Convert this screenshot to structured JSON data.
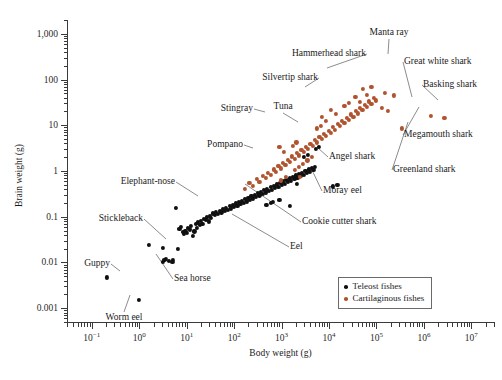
{
  "chart_data": {
    "type": "scatter",
    "title": "",
    "xlabel": "Body weight (g)",
    "ylabel": "Brain weight (g)",
    "xscale": "log",
    "yscale": "log",
    "xlim": [
      0.03,
      30000000
    ],
    "ylim": [
      0.0005,
      2000
    ],
    "grid": false,
    "legend_position": "bottom-right",
    "xticks": [
      {
        "value": 0.1,
        "label": "10",
        "exp": "−1"
      },
      {
        "value": 1,
        "label": "10",
        "exp": "0"
      },
      {
        "value": 10,
        "label": "10",
        "exp": "1"
      },
      {
        "value": 100,
        "label": "10",
        "exp": "2"
      },
      {
        "value": 1000,
        "label": "10",
        "exp": "3"
      },
      {
        "value": 10000,
        "label": "10",
        "exp": "4"
      },
      {
        "value": 100000,
        "label": "10",
        "exp": "5"
      },
      {
        "value": 1000000,
        "label": "10",
        "exp": "6"
      },
      {
        "value": 10000000,
        "label": "10",
        "exp": "7"
      }
    ],
    "yticks": [
      {
        "value": 1000,
        "label": "1,000"
      },
      {
        "value": 100,
        "label": "100"
      },
      {
        "value": 10,
        "label": "10"
      },
      {
        "value": 1,
        "label": "1"
      },
      {
        "value": 0.1,
        "label": "0.1"
      },
      {
        "value": 0.01,
        "label": "0.01"
      },
      {
        "value": 0.001,
        "label": "0.001"
      }
    ],
    "legend": [
      {
        "name": "Teleost fishes",
        "color": "#101010",
        "key": "teleost"
      },
      {
        "name": "Cartilaginous fishes",
        "color": "#b0542f",
        "key": "cart"
      }
    ],
    "series": [
      {
        "name": "Teleost fishes",
        "key": "teleost",
        "color": "#101010",
        "points": [
          [
            0.21,
            0.0047
          ],
          [
            1.0,
            0.00155
          ],
          [
            1.6,
            0.024
          ],
          [
            3.1,
            0.021
          ],
          [
            3.2,
            0.0105
          ],
          [
            3.4,
            0.0112
          ],
          [
            3.6,
            0.0118
          ],
          [
            4.3,
            0.0108
          ],
          [
            5.0,
            0.0105
          ],
          [
            5.2,
            0.0112
          ],
          [
            6.0,
            0.155
          ],
          [
            6.4,
            0.02
          ],
          [
            7.0,
            0.055
          ],
          [
            7.6,
            0.06
          ],
          [
            8.2,
            0.047
          ],
          [
            8.8,
            0.042
          ],
          [
            9.4,
            0.05
          ],
          [
            10.0,
            0.044
          ],
          [
            10.6,
            0.058
          ],
          [
            11.5,
            0.053
          ],
          [
            12.5,
            0.062
          ],
          [
            13.5,
            0.038
          ],
          [
            14.5,
            0.048
          ],
          [
            15.5,
            0.069
          ],
          [
            16.5,
            0.058
          ],
          [
            17.5,
            0.075
          ],
          [
            19.0,
            0.066
          ],
          [
            20.0,
            0.08
          ],
          [
            21.5,
            0.071
          ],
          [
            23.0,
            0.09
          ],
          [
            25.0,
            0.085
          ],
          [
            27.0,
            0.097
          ],
          [
            29.0,
            0.079
          ],
          [
            31.0,
            0.105
          ],
          [
            33.0,
            0.094
          ],
          [
            36.0,
            0.118
          ],
          [
            39.0,
            0.108
          ],
          [
            42.0,
            0.127
          ],
          [
            46.0,
            0.115
          ],
          [
            50.0,
            0.136
          ],
          [
            54.0,
            0.124
          ],
          [
            58.0,
            0.148
          ],
          [
            63.0,
            0.133
          ],
          [
            68.0,
            0.158
          ],
          [
            74.0,
            0.142
          ],
          [
            80.0,
            0.17
          ],
          [
            86.0,
            0.152
          ],
          [
            93.0,
            0.182
          ],
          [
            100.0,
            0.163
          ],
          [
            108.0,
            0.196
          ],
          [
            117.0,
            0.175
          ],
          [
            126.0,
            0.21
          ],
          [
            136.0,
            0.188
          ],
          [
            147.0,
            0.226
          ],
          [
            158.0,
            0.202
          ],
          [
            171.0,
            0.243
          ],
          [
            185.0,
            0.217
          ],
          [
            200.0,
            0.262
          ],
          [
            215.0,
            0.234
          ],
          [
            232.0,
            0.282
          ],
          [
            250.0,
            0.252
          ],
          [
            270.0,
            0.304
          ],
          [
            292.0,
            0.272
          ],
          [
            315.0,
            0.327
          ],
          [
            340.0,
            0.293
          ],
          [
            367.0,
            0.352
          ],
          [
            397.0,
            0.316
          ],
          [
            430.0,
            0.38
          ],
          [
            465.0,
            0.34
          ],
          [
            500.0,
            0.408
          ],
          [
            540.0,
            0.366
          ],
          [
            585.0,
            0.44
          ],
          [
            630.0,
            0.394
          ],
          [
            680.0,
            0.474
          ],
          [
            735.0,
            0.424
          ],
          [
            795.0,
            0.51
          ],
          [
            860.0,
            0.457
          ],
          [
            930.0,
            0.55
          ],
          [
            1000.0,
            0.492
          ],
          [
            1080.0,
            0.592
          ],
          [
            1170.0,
            0.53
          ],
          [
            1260.0,
            0.638
          ],
          [
            1360.0,
            0.571
          ],
          [
            1470.0,
            0.688
          ],
          [
            1590.0,
            0.615
          ],
          [
            1720.0,
            0.741
          ],
          [
            1860.0,
            0.663
          ],
          [
            2000.0,
            0.798
          ],
          [
            2160.0,
            0.714
          ],
          [
            2330.0,
            0.86
          ],
          [
            2520.0,
            0.77
          ],
          [
            2720.0,
            0.927
          ],
          [
            2940.0,
            0.83
          ],
          [
            3180.0,
            1.0
          ],
          [
            3430.0,
            0.894
          ],
          [
            3700.0,
            1.08
          ],
          [
            4000.0,
            0.963
          ],
          [
            4320.0,
            1.16
          ],
          [
            4670.0,
            1.04
          ],
          [
            5000.0,
            1.25
          ],
          [
            1500.0,
            0.175
          ],
          [
            2100.0,
            0.52
          ],
          [
            900.0,
            0.235
          ],
          [
            12000.0,
            0.46
          ],
          [
            15000.0,
            0.5
          ],
          [
            600.0,
            0.2
          ],
          [
            650.0,
            0.215
          ],
          [
            480.0,
            0.185
          ],
          [
            3000.0,
            2.05
          ],
          [
            3600.0,
            2.25
          ],
          [
            5200.0,
            3.0
          ],
          [
            6000.0,
            3.3
          ]
        ]
      },
      {
        "name": "Cartilaginous fishes",
        "key": "cart",
        "color": "#b0542f",
        "points": [
          [
            170.0,
            0.4
          ],
          [
            210.0,
            0.55
          ],
          [
            250.0,
            0.48
          ],
          [
            300.0,
            0.66
          ],
          [
            340.0,
            0.58
          ],
          [
            400.0,
            0.78
          ],
          [
            460.0,
            0.7
          ],
          [
            520.0,
            0.92
          ],
          [
            600.0,
            0.82
          ],
          [
            680.0,
            1.08
          ],
          [
            760.0,
            0.96
          ],
          [
            860.0,
            1.27
          ],
          [
            960.0,
            1.14
          ],
          [
            1080.0,
            1.5
          ],
          [
            1200.0,
            1.34
          ],
          [
            1350.0,
            1.76
          ],
          [
            1500.0,
            1.58
          ],
          [
            1680.0,
            2.08
          ],
          [
            1880.0,
            1.86
          ],
          [
            2100.0,
            2.45
          ],
          [
            2350.0,
            2.19
          ],
          [
            2620.0,
            2.88
          ],
          [
            2920.0,
            2.58
          ],
          [
            3260.0,
            3.39
          ],
          [
            3640.0,
            3.03
          ],
          [
            4060.0,
            3.99
          ],
          [
            4530.0,
            3.57
          ],
          [
            5060.0,
            4.7
          ],
          [
            5640.0,
            4.2
          ],
          [
            6290.0,
            5.53
          ],
          [
            7020.0,
            4.95
          ],
          [
            7830.0,
            6.51
          ],
          [
            8740.0,
            5.83
          ],
          [
            9750.0,
            7.66
          ],
          [
            10900.0,
            6.86
          ],
          [
            12150.0,
            9.02
          ],
          [
            13560.0,
            8.07
          ],
          [
            15130.0,
            10.6
          ],
          [
            16880.0,
            9.5
          ],
          [
            18840.0,
            12.5
          ],
          [
            21020.0,
            11.2
          ],
          [
            23460.0,
            14.7
          ],
          [
            26180.0,
            13.2
          ],
          [
            29210.0,
            17.3
          ],
          [
            32600.0,
            15.5
          ],
          [
            36380.0,
            20.4
          ],
          [
            40590.0,
            18.2
          ],
          [
            45300.0,
            24.0
          ],
          [
            50550.0,
            21.5
          ],
          [
            56410.0,
            28.2
          ],
          [
            62950.0,
            25.2
          ],
          [
            70240.0,
            33.2
          ],
          [
            78390.0,
            29.7
          ],
          [
            87480.0,
            39.1
          ],
          [
            97610.0,
            35.0
          ],
          [
            2800.0,
            1.45
          ],
          [
            3500.0,
            1.7
          ],
          [
            4400.0,
            2.0
          ],
          [
            1900.0,
            1.05
          ],
          [
            2300.0,
            1.22
          ],
          [
            980.0,
            0.62
          ],
          [
            1250.0,
            0.74
          ],
          [
            1700.0,
            3.6
          ],
          [
            2050.0,
            4.2
          ],
          [
            5500.0,
            8.5
          ],
          [
            6800.0,
            9.8
          ],
          [
            150000.0,
            52.0
          ],
          [
            230000.0,
            45.0
          ],
          [
            2400.0,
            0.74
          ],
          [
            340000.0,
            8.5
          ],
          [
            1400000.0,
            16.0
          ],
          [
            2700000.0,
            14.5
          ],
          [
            130000.0,
            24.0
          ],
          [
            175000.0,
            20.5
          ],
          [
            900.0,
            3.3
          ],
          [
            1100.0,
            2.6
          ],
          [
            52000.0,
            62.0
          ],
          [
            64000.0,
            47.0
          ],
          [
            78000.0,
            70.0
          ],
          [
            36000.0,
            42.0
          ],
          [
            44000.0,
            33.0
          ],
          [
            21000.0,
            26.0
          ],
          [
            26000.0,
            31.0
          ],
          [
            14000.0,
            17.5
          ],
          [
            11000.0,
            22.0
          ],
          [
            8500.0,
            12.5
          ],
          [
            7200.0,
            15.5
          ]
        ]
      }
    ],
    "annotations": [
      {
        "label": "Manta ray",
        "tx": 389,
        "ty": 27,
        "anchor": "c",
        "px": 388,
        "py": 54
      },
      {
        "label": "Hammerhead shark",
        "tx": 366,
        "ty": 48,
        "anchor": "r",
        "px": 327,
        "py": 68
      },
      {
        "label": "Great white shark",
        "tx": 404,
        "ty": 56,
        "anchor": "l",
        "px": 412,
        "py": 97
      },
      {
        "label": "Silvertip shark",
        "tx": 318,
        "ty": 72,
        "anchor": "r",
        "px": 305,
        "py": 87
      },
      {
        "label": "Basking shark",
        "tx": 423,
        "ty": 79,
        "anchor": "l",
        "px": 438,
        "py": 100
      },
      {
        "label": "Stingray",
        "tx": 253,
        "ty": 103,
        "anchor": "r",
        "px": 265,
        "py": 112
      },
      {
        "label": "Tuna",
        "tx": 283,
        "ty": 101,
        "anchor": "c",
        "px": 298,
        "py": 122
      },
      {
        "label": "Megamouth shark",
        "tx": 404,
        "ty": 129,
        "anchor": "l",
        "px": 419,
        "py": 107
      },
      {
        "label": "Pompano",
        "tx": 243,
        "ty": 139,
        "anchor": "r",
        "px": 253,
        "py": 148
      },
      {
        "label": "Angel shark",
        "tx": 329,
        "ty": 151,
        "anchor": "l",
        "px": 318,
        "py": 148
      },
      {
        "label": "Greenland shark",
        "tx": 393,
        "ty": 164,
        "anchor": "l",
        "px": 408,
        "py": 122
      },
      {
        "label": "Elephant-nose",
        "tx": 175,
        "ty": 176,
        "anchor": "r",
        "px": 198,
        "py": 196
      },
      {
        "label": "Moray eel",
        "tx": 323,
        "ty": 185,
        "anchor": "l",
        "px": 311,
        "py": 168
      },
      {
        "label": "Stickleback",
        "tx": 143,
        "ty": 213,
        "anchor": "r",
        "px": 166,
        "py": 239
      },
      {
        "label": "Cookie cutter shark",
        "tx": 302,
        "ty": 216,
        "anchor": "l",
        "px": 245,
        "py": 184
      },
      {
        "label": "Eel",
        "tx": 290,
        "ty": 241,
        "anchor": "l",
        "px": 232,
        "py": 214
      },
      {
        "label": "Guppy",
        "tx": 110,
        "ty": 258,
        "anchor": "r",
        "px": 120,
        "py": 271
      },
      {
        "label": "Sea horse",
        "tx": 174,
        "ty": 273,
        "anchor": "l",
        "px": 156,
        "py": 254
      },
      {
        "label": "Worm eel",
        "tx": 124,
        "ty": 312,
        "anchor": "c",
        "px": 130,
        "py": 295
      }
    ]
  },
  "caption": {
    "text": ""
  }
}
